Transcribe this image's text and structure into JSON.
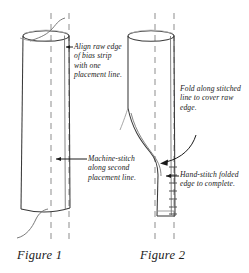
{
  "diagram": {
    "type": "sewing-instruction-line-drawing",
    "background_color": "#ffffff",
    "line_color": "#3a3a3a",
    "guide_line_color": "#8a8a8a",
    "text_color": "#1a1a1a"
  },
  "figures": [
    {
      "id": "figure-1",
      "caption": "Figure 1",
      "callouts": [
        {
          "id": "callout-align-raw-edge",
          "text": "Align raw edge of bias strip with one placement line.",
          "arrow": "points-left"
        },
        {
          "id": "callout-machine-stitch",
          "text": "Machine-stitch along second placement line.",
          "arrow": "points-left"
        }
      ],
      "placement_lines": 2
    },
    {
      "id": "figure-2",
      "caption": "Figure 2",
      "callouts": [
        {
          "id": "callout-fold-along",
          "text": "Fold along stitched line to cover raw edge.",
          "arrow": "curved-points-down-left"
        },
        {
          "id": "callout-hand-stitch",
          "text": "Hand-stitch folded edge to complete.",
          "arrow": "points-left"
        }
      ],
      "placement_lines": 2
    }
  ]
}
